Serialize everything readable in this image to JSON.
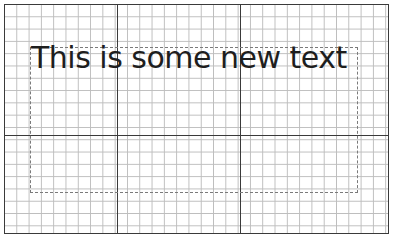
{
  "canvas": {
    "grid": {
      "cell_size_px": 12.3,
      "minor_color": "#bdbdbd",
      "major_color": "#3a3a3a"
    },
    "major_lines": {
      "vertical_x": [
        117,
        240
      ],
      "horizontal_y": [
        135
      ]
    }
  },
  "text_box": {
    "content": "This is some new text",
    "text_color": "#1e1e1e",
    "frame_style": "dashed"
  }
}
